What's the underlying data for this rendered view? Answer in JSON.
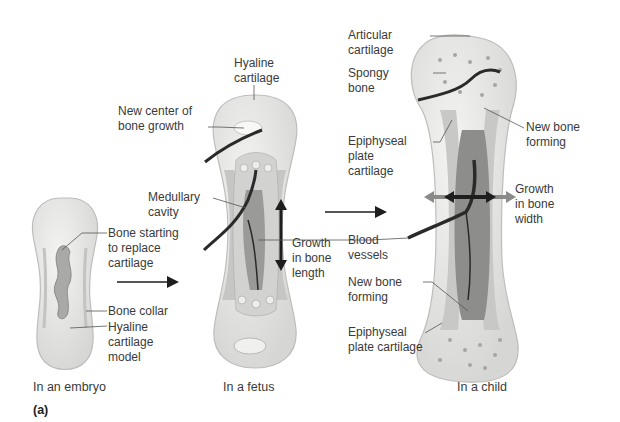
{
  "figure": {
    "panel_label": "(a)",
    "colors": {
      "cartilage": "#e6e6e4",
      "cartilage_edge": "#bdbdbb",
      "bone_shaft": "#c9c9c7",
      "cavity": "#8f8f8d",
      "vessel": "#2a2a2a",
      "arrow_dark": "#1e1e1e",
      "arrow_grey": "#8a8a88",
      "leader": "#555555",
      "text": "#3a3a3a"
    }
  },
  "stages": [
    {
      "id": "embryo",
      "caption": "In an embryo",
      "labels": [
        {
          "text": "Bone starting\nto replace\ncartilage"
        },
        {
          "text": "Bone collar"
        },
        {
          "text": "Hyaline\ncartilage\nmodel"
        }
      ]
    },
    {
      "id": "fetus",
      "caption": "In a fetus",
      "labels": [
        {
          "text": "Hyaline\ncartilage"
        },
        {
          "text": "New center of\nbone growth"
        },
        {
          "text": "Medullary\ncavity"
        },
        {
          "text": "Growth\nin bone\nlength"
        }
      ]
    },
    {
      "id": "child",
      "caption": "In a child",
      "labels": [
        {
          "text": "Articular\ncartilage"
        },
        {
          "text": "Spongy\nbone"
        },
        {
          "text": "Epiphyseal\nplate\ncartilage"
        },
        {
          "text": "New bone\nforming"
        },
        {
          "text": "Growth\nin bone\nwidth"
        },
        {
          "text": "Blood\nvessels"
        },
        {
          "text": "New bone\nforming"
        },
        {
          "text": "Epiphyseal\nplate cartilage"
        }
      ]
    }
  ]
}
